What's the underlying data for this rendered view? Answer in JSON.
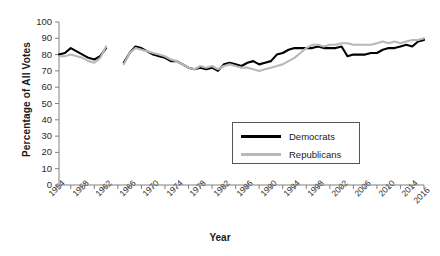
{
  "chart_data": {
    "type": "line",
    "title": "",
    "xlabel": "Year",
    "ylabel": "Percentage of All Votes",
    "ylim": [
      0,
      100
    ],
    "xlim": [
      1954,
      2016
    ],
    "yticks": [
      0,
      10,
      20,
      30,
      40,
      50,
      60,
      70,
      80,
      90,
      100
    ],
    "xticks": [
      1954,
      1958,
      1962,
      1966,
      1970,
      1974,
      1978,
      1982,
      1986,
      1990,
      1994,
      1998,
      2002,
      2006,
      2010,
      2014,
      2016
    ],
    "xtick_minor_step": 2,
    "grid": false,
    "legend_position": "center-right",
    "series": [
      {
        "name": "Democrats",
        "color": "#000000",
        "x": [
          1954,
          1955,
          1956,
          1957,
          1958,
          1959,
          1960,
          1961,
          1962,
          1965,
          1966,
          1967,
          1968,
          1969,
          1970,
          1971,
          1972,
          1973,
          1974,
          1975,
          1976,
          1977,
          1978,
          1979,
          1980,
          1981,
          1982,
          1983,
          1984,
          1985,
          1986,
          1987,
          1988,
          1989,
          1990,
          1991,
          1992,
          1993,
          1994,
          1995,
          1996,
          1997,
          1998,
          1999,
          2000,
          2001,
          2002,
          2003,
          2004,
          2005,
          2006,
          2007,
          2008,
          2009,
          2010,
          2011,
          2012,
          2013,
          2014,
          2015,
          2016
        ],
        "y": [
          80,
          81,
          84,
          82,
          80,
          78,
          77,
          79,
          84,
          75,
          81,
          85,
          84,
          82,
          80,
          79,
          78,
          76,
          76,
          74,
          72,
          71,
          72,
          71,
          72,
          70,
          74,
          75,
          74,
          73,
          75,
          76,
          74,
          75,
          76,
          80,
          81,
          83,
          84,
          84,
          84,
          84,
          85,
          84,
          84,
          84,
          85,
          79,
          80,
          80,
          80,
          81,
          81,
          83,
          84,
          84,
          85,
          86,
          85,
          88,
          89
        ],
        "gap_after": 1962
      },
      {
        "name": "Republicans",
        "color": "#b8b8b8",
        "x": [
          1954,
          1955,
          1956,
          1957,
          1958,
          1959,
          1960,
          1961,
          1962,
          1965,
          1966,
          1967,
          1968,
          1969,
          1970,
          1971,
          1972,
          1973,
          1974,
          1975,
          1976,
          1977,
          1978,
          1979,
          1980,
          1981,
          1982,
          1983,
          1984,
          1985,
          1986,
          1987,
          1988,
          1989,
          1990,
          1991,
          1992,
          1993,
          1994,
          1995,
          1996,
          1997,
          1998,
          1999,
          2000,
          2001,
          2002,
          2003,
          2004,
          2005,
          2006,
          2007,
          2008,
          2009,
          2010,
          2011,
          2012,
          2013,
          2014,
          2015,
          2016
        ],
        "y": [
          79,
          79,
          80,
          79,
          78,
          76,
          75,
          78,
          85,
          74,
          81,
          84,
          83,
          82,
          81,
          80,
          79,
          77,
          76,
          74,
          72,
          71,
          73,
          72,
          73,
          71,
          73,
          74,
          73,
          72,
          72,
          71,
          70,
          71,
          72,
          73,
          74,
          76,
          78,
          81,
          84,
          86,
          86,
          85,
          86,
          86,
          87,
          87,
          86,
          86,
          86,
          86,
          87,
          88,
          87,
          88,
          87,
          88,
          89,
          89,
          90
        ],
        "gap_after": 1962
      }
    ],
    "legend": [
      {
        "label": "Democrats",
        "color": "#000000"
      },
      {
        "label": "Republicans",
        "color": "#b8b8b8"
      }
    ]
  },
  "axis": {
    "y_title": "Percentage of All Votes",
    "x_title": "Year"
  }
}
